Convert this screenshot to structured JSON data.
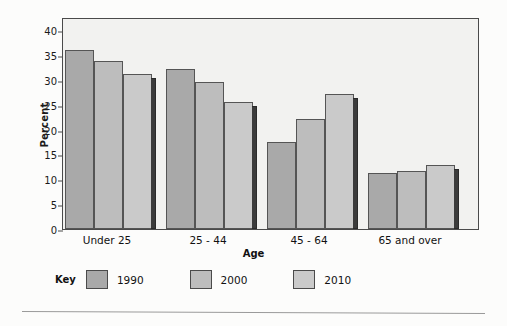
{
  "chart_data": {
    "type": "bar",
    "title": "",
    "xlabel": "Age",
    "ylabel": "Percent",
    "categories": [
      "Under 25",
      "25 - 44",
      "45 - 64",
      "65 and over"
    ],
    "series": [
      {
        "name": "1990",
        "color": "#a9a9a9",
        "values": [
          36.0,
          32.1,
          17.4,
          11.3
        ]
      },
      {
        "name": "2000",
        "color": "#bdbdbd",
        "values": [
          33.8,
          29.6,
          22.2,
          11.7
        ]
      },
      {
        "name": "2010",
        "color": "#cacaca",
        "values": [
          31.2,
          25.5,
          27.2,
          12.9
        ]
      }
    ],
    "ylim": [
      0,
      40
    ],
    "yticks": [
      0,
      5,
      10,
      15,
      20,
      25,
      30,
      35,
      40
    ],
    "ytick_labels": [
      "0",
      "5",
      "10",
      "15",
      "20",
      "25",
      "30",
      "35",
      "40"
    ],
    "grid": false,
    "legend_position": "bottom",
    "legend_title": "Key"
  },
  "axes": {
    "y_label": "Percent",
    "x_label": "Age"
  },
  "legend": {
    "title": "Key",
    "items": [
      {
        "label": "1990",
        "color": "#a9a9a9"
      },
      {
        "label": "2000",
        "color": "#bdbdbd"
      },
      {
        "label": "2010",
        "color": "#cacaca"
      }
    ]
  },
  "colors": {
    "plot_background": "#f2f2f0",
    "frame": "#4a4a4a",
    "bar_outline": "#555555",
    "bar_shadow": "#3b3b3b",
    "text": "#111111"
  }
}
